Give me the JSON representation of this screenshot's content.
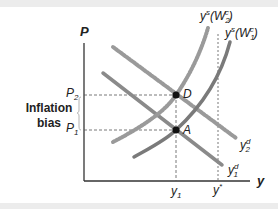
{
  "diagram": {
    "type": "economics-supply-demand",
    "axes": {
      "y_label": "P",
      "x_label": "y"
    },
    "price_ticks": [
      {
        "main": "P",
        "sub": "2"
      },
      {
        "main": "P",
        "sub": "1"
      }
    ],
    "output_ticks": [
      {
        "main": "y",
        "sub": "1",
        "sup": ""
      },
      {
        "main": "y",
        "sub": "",
        "sup": "*"
      }
    ],
    "annotation": {
      "line1": "Inflation",
      "line2": "bias"
    },
    "curves": {
      "supply_2": {
        "main": "y",
        "sup": "s",
        "arg": "(W",
        "arg_sub": "2",
        "arg_sup": "c",
        "close": ")"
      },
      "supply_1": {
        "main": "y",
        "sup": "s",
        "arg": "(W",
        "arg_sub": "1",
        "arg_sup": "c",
        "close": ")"
      },
      "demand_2": {
        "main": "y",
        "sup": "d",
        "sub": "2"
      },
      "demand_1": {
        "main": "y",
        "sup": "d",
        "sub": "1"
      }
    },
    "points": {
      "D": "D",
      "A": "A"
    },
    "colors": {
      "axis": "#333333",
      "curve_solid": "#7a7a7a",
      "curve_dashed": "#9a9a9a",
      "guide": "#555555",
      "band": "#ececec"
    }
  }
}
